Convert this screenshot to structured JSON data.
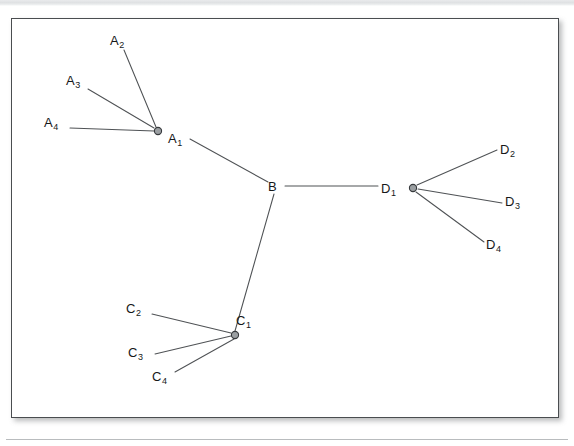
{
  "figure": {
    "kind": "star-tree-network-diagram",
    "frame": {
      "x": 11,
      "y": 18,
      "width": 548,
      "height": 400
    },
    "colors": {
      "page_background": "#ffffff",
      "frame_border": "#4a4d50",
      "edge_stroke": "#4f5255",
      "node_fill": "#9b9fa2",
      "node_stroke": "#36393c",
      "label_text": "#161819",
      "scan_band": "#dfe1e3"
    }
  },
  "chart_data": {
    "type": "diagram",
    "title": "",
    "nodes": [
      {
        "id": "B",
        "label": "B",
        "sub": "",
        "x": 275,
        "y": 187,
        "marker": "none",
        "label_x": 268,
        "label_y": 180,
        "role": "central-hub"
      },
      {
        "id": "A1",
        "label": "A",
        "sub": "1",
        "x": 158,
        "y": 131,
        "marker": "circle",
        "label_x": 168,
        "label_y": 132,
        "role": "cluster-head"
      },
      {
        "id": "A2",
        "label": "A",
        "sub": "2",
        "x": 124,
        "y": 50,
        "marker": "none",
        "label_x": 110,
        "label_y": 34,
        "role": "leaf"
      },
      {
        "id": "A3",
        "label": "A",
        "sub": "3",
        "x": 88,
        "y": 89,
        "marker": "none",
        "label_x": 66,
        "label_y": 74,
        "role": "leaf"
      },
      {
        "id": "A4",
        "label": "A",
        "sub": "4",
        "x": 70,
        "y": 128,
        "marker": "none",
        "label_x": 44,
        "label_y": 116,
        "role": "leaf"
      },
      {
        "id": "C1",
        "label": "C",
        "sub": "1",
        "x": 235,
        "y": 335,
        "marker": "circle",
        "label_x": 236,
        "label_y": 314,
        "role": "cluster-head"
      },
      {
        "id": "C2",
        "label": "C",
        "sub": "2",
        "x": 152,
        "y": 314,
        "marker": "none",
        "label_x": 126,
        "label_y": 302,
        "role": "leaf"
      },
      {
        "id": "C3",
        "label": "C",
        "sub": "3",
        "x": 155,
        "y": 354,
        "marker": "none",
        "label_x": 128,
        "label_y": 346,
        "role": "leaf"
      },
      {
        "id": "C4",
        "label": "C",
        "sub": "4",
        "x": 175,
        "y": 372,
        "marker": "none",
        "label_x": 152,
        "label_y": 370,
        "role": "leaf"
      },
      {
        "id": "D1",
        "label": "D",
        "sub": "1",
        "x": 413,
        "y": 188,
        "marker": "circle",
        "label_x": 381,
        "label_y": 182,
        "role": "cluster-head"
      },
      {
        "id": "D2",
        "label": "D",
        "sub": "2",
        "x": 497,
        "y": 150,
        "marker": "none",
        "label_x": 500,
        "label_y": 143,
        "role": "leaf"
      },
      {
        "id": "D3",
        "label": "D",
        "sub": "3",
        "x": 502,
        "y": 203,
        "marker": "none",
        "label_x": 505,
        "label_y": 195,
        "role": "leaf"
      },
      {
        "id": "D4",
        "label": "D",
        "sub": "4",
        "x": 484,
        "y": 242,
        "marker": "none",
        "label_x": 486,
        "label_y": 238,
        "role": "leaf"
      }
    ],
    "edges": [
      {
        "from": "A1",
        "to": "B",
        "x1": 190,
        "y1": 139,
        "x2": 268,
        "y2": 182
      },
      {
        "from": "B",
        "to": "D1",
        "x1": 285,
        "y1": 186,
        "x2": 378,
        "y2": 186
      },
      {
        "from": "B",
        "to": "C1",
        "x1": 274,
        "y1": 194,
        "x2": 235,
        "y2": 331
      },
      {
        "from": "A2",
        "to": "A1",
        "x1": 124,
        "y1": 50,
        "x2": 156,
        "y2": 127
      },
      {
        "from": "A3",
        "to": "A1",
        "x1": 88,
        "y1": 89,
        "x2": 154,
        "y2": 128
      },
      {
        "from": "A4",
        "to": "A1",
        "x1": 70,
        "y1": 128,
        "x2": 154,
        "y2": 131
      },
      {
        "from": "C2",
        "to": "C1",
        "x1": 152,
        "y1": 314,
        "x2": 231,
        "y2": 333
      },
      {
        "from": "C3",
        "to": "C1",
        "x1": 155,
        "y1": 354,
        "x2": 231,
        "y2": 336
      },
      {
        "from": "C4",
        "to": "C1",
        "x1": 175,
        "y1": 372,
        "x2": 234,
        "y2": 339
      },
      {
        "from": "D1",
        "to": "D2",
        "x1": 417,
        "y1": 185,
        "x2": 497,
        "y2": 150
      },
      {
        "from": "D1",
        "to": "D3",
        "x1": 418,
        "y1": 189,
        "x2": 502,
        "y2": 203
      },
      {
        "from": "D1",
        "to": "D4",
        "x1": 416,
        "y1": 192,
        "x2": 484,
        "y2": 242
      }
    ],
    "node_radius": 3.6,
    "legend": [],
    "annotations": []
  }
}
